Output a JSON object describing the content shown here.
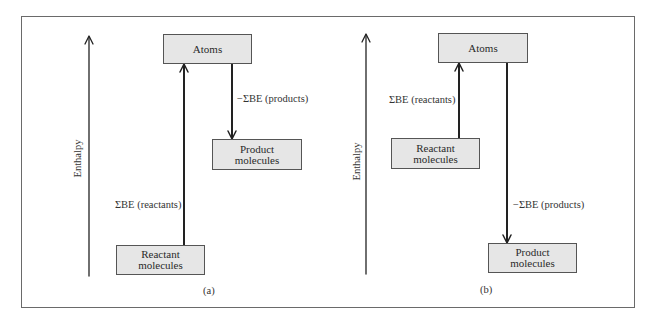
{
  "panels": [
    {
      "id": "a",
      "caption": "(a)",
      "axis_label": "Enthalpy",
      "atoms_box": "Atoms",
      "reactant_box": [
        "Reactant",
        "molecules"
      ],
      "product_box": [
        "Product",
        "molecules"
      ],
      "reactants_arrow_label": "ΣBE (reactants)",
      "products_arrow_label": "−ΣBE (products)"
    },
    {
      "id": "b",
      "caption": "(b)",
      "axis_label": "Enthalpy",
      "atoms_box": "Atoms",
      "reactant_box": [
        "Reactant",
        "molecules"
      ],
      "product_box": [
        "Product",
        "molecules"
      ],
      "reactants_arrow_label": "ΣBE (reactants)",
      "products_arrow_label": "−ΣBE (products)"
    }
  ],
  "colors": {
    "box_fill": "#e6e6e6",
    "line": "#222222",
    "frame": "#6a6a6a"
  }
}
